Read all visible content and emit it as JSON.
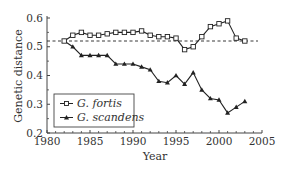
{
  "chart_data": {
    "type": "line",
    "title": "",
    "xlabel": "Year",
    "ylabel": "Genetic distance",
    "xlim": [
      1980,
      2005
    ],
    "ylim": [
      0.2,
      0.6
    ],
    "xticks": [
      1980,
      1985,
      1990,
      1995,
      2000,
      2005
    ],
    "yticks": [
      0.2,
      0.3,
      0.4,
      0.5,
      0.6
    ],
    "xtick_labels": [
      "1980",
      "1985",
      "1990",
      "1995",
      "2000",
      "2005"
    ],
    "ytick_labels": [
      "0.2",
      "0.3",
      "0.4",
      "0.5",
      "0.6"
    ],
    "grid": false,
    "legend_position": "lower left",
    "reference_line": {
      "y": 0.52,
      "style": "dashed"
    },
    "x": [
      1982,
      1983,
      1984,
      1985,
      1986,
      1987,
      1988,
      1989,
      1990,
      1991,
      1992,
      1993,
      1994,
      1995,
      1996,
      1997,
      1998,
      1999,
      2000,
      2001,
      2002,
      2003
    ],
    "series": [
      {
        "name": "G. fortis",
        "marker": "open-square",
        "values": [
          0.52,
          0.54,
          0.55,
          0.54,
          0.54,
          0.545,
          0.55,
          0.55,
          0.55,
          0.555,
          0.54,
          0.535,
          0.535,
          0.53,
          0.49,
          0.5,
          0.535,
          0.57,
          0.58,
          0.59,
          0.53,
          0.52
        ]
      },
      {
        "name": "G. scandens",
        "marker": "filled-triangle",
        "values": [
          0.52,
          0.5,
          0.47,
          0.47,
          0.47,
          0.47,
          0.44,
          0.44,
          0.44,
          0.43,
          0.42,
          0.38,
          0.375,
          0.4,
          0.37,
          0.41,
          0.35,
          0.32,
          0.315,
          0.27,
          0.29,
          0.31
        ]
      }
    ]
  },
  "legend": {
    "items": [
      {
        "label": "G. fortis"
      },
      {
        "label": "G. scandens"
      }
    ]
  },
  "colors": {
    "line": "#222222",
    "axis": "#444444",
    "text": "#333333"
  }
}
